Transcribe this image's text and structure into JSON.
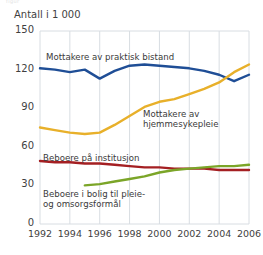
{
  "ghost_title": "figur",
  "axis_title": "Antall i 1 000",
  "labels": {
    "bistand": "Mottakere av praktisk bistand",
    "hjemme": "Mottakere av\nhjemmesykepleie",
    "institusjon": "Beboere på institusjon",
    "bolig": "Beboere i bolig til pleie-\nog omsorgsformål"
  },
  "colors": {
    "bistand": "#1f4e96",
    "hjemme": "#e8b02a",
    "institusjon": "#a41f22",
    "bolig": "#7ba528",
    "grid": "#d8dde2",
    "text": "#3f3f3f"
  },
  "chart_data": {
    "type": "line",
    "title": "",
    "xlabel": "",
    "ylabel": "Antall i 1 000",
    "xlim": [
      1992,
      2006
    ],
    "ylim": [
      0,
      150
    ],
    "yticks": [
      0,
      30,
      60,
      90,
      120,
      150
    ],
    "xticks": [
      1992,
      1994,
      1996,
      1998,
      2000,
      2002,
      2004,
      2006
    ],
    "grid": true,
    "legend": "inline-annotations",
    "x": [
      1992,
      1993,
      1994,
      1995,
      1996,
      1997,
      1998,
      1999,
      2000,
      2001,
      2002,
      2003,
      2004,
      2005,
      2006
    ],
    "series": [
      {
        "name": "Mottakere av praktisk bistand",
        "color": "#1f4e96",
        "values": [
          121,
          120,
          118,
          120,
          113,
          119,
          123,
          124,
          123,
          122,
          121,
          119,
          116,
          111,
          116
        ]
      },
      {
        "name": "Mottakere av hjemmesykepleie",
        "color": "#e8b02a",
        "values": [
          75,
          73,
          71,
          70,
          71,
          77,
          84,
          91,
          95,
          97,
          101,
          105,
          110,
          118,
          124
        ]
      },
      {
        "name": "Beboere på institusjon",
        "color": "#a41f22",
        "values": [
          49,
          48,
          48,
          47,
          47,
          46,
          45,
          44,
          44,
          43,
          43,
          43,
          42,
          42,
          42
        ]
      },
      {
        "name": "Beboere i bolig til pleie- og omsorgsformål",
        "color": "#7ba528",
        "values": [
          null,
          null,
          null,
          30,
          31,
          33,
          35,
          37,
          40,
          42,
          43,
          44,
          45,
          45,
          46
        ]
      }
    ]
  }
}
